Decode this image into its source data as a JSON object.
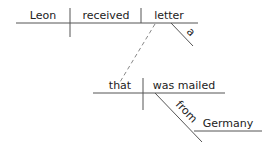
{
  "diagram": {
    "type": "sentence-diagram",
    "main_clause": {
      "subject": "Leon",
      "verb": "received",
      "object": "letter",
      "object_modifier": "a"
    },
    "relative_clause": {
      "subject": "that",
      "verb": "was mailed",
      "preposition": "from",
      "prepositional_object": "Germany"
    },
    "colors": {
      "line": "#555555",
      "text": "#222222",
      "dashed": "#888888"
    }
  }
}
